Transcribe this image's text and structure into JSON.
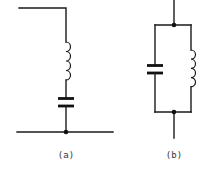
{
  "figure": {
    "type": "circuit-diagram",
    "colors": {
      "line": "#1a1a1a",
      "background": "#ffffff",
      "label": "#333333"
    },
    "circuits": [
      {
        "id": "a",
        "label": "(a)",
        "topology": "series",
        "components": [
          "inductor",
          "capacitor"
        ],
        "junctions": 1
      },
      {
        "id": "b",
        "label": "(b)",
        "topology": "parallel",
        "components": [
          "capacitor",
          "inductor"
        ],
        "junctions": 2
      }
    ]
  }
}
